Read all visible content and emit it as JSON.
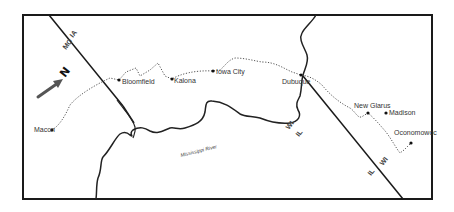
{
  "map": {
    "frame": {
      "x": 23,
      "y": 15,
      "width": 409,
      "height": 184,
      "stroke": "#1a1a1a"
    },
    "compass": {
      "label": "N",
      "icon": "north-arrow-icon",
      "color": "#555555"
    },
    "river": {
      "label": "Mississippi River",
      "color": "#222222"
    },
    "borders": {
      "left": {
        "labels": [
          "IA",
          "MO"
        ]
      },
      "right_upper": {
        "labels": [
          "WI",
          "IL"
        ]
      },
      "right_lower": {
        "labels": [
          "WI",
          "IL"
        ]
      }
    },
    "route": {
      "style": "dotted",
      "color": "#555555"
    },
    "cities": [
      {
        "name": "Macon",
        "x": 52,
        "y": 130
      },
      {
        "name": "Bloomfield",
        "x": 119,
        "y": 80
      },
      {
        "name": "Kalona",
        "x": 172,
        "y": 79
      },
      {
        "name": "Iowa City",
        "x": 213,
        "y": 70
      },
      {
        "name": "Dubuque",
        "x": 301,
        "y": 75
      },
      {
        "name": "New Glarus",
        "x": 368,
        "y": 113
      },
      {
        "name": "Madison",
        "x": 386,
        "y": 113
      },
      {
        "name": "Oconomowoc",
        "x": 411,
        "y": 143
      }
    ]
  }
}
